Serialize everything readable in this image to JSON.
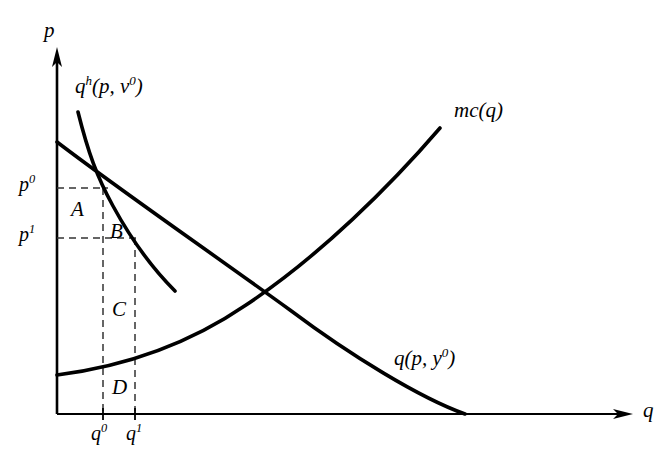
{
  "figure": {
    "background_color": "#ffffff",
    "line_color": "#000000",
    "dash_color": "#4d4d4d"
  },
  "axes": {
    "vertical": {
      "name": "vertical-axis",
      "label": "p",
      "x": 57,
      "y_top": 50,
      "y_bottom": 414
    },
    "horizontal": {
      "name": "horizontal-axis",
      "label": "q",
      "y": 414,
      "x_left": 57,
      "x_right": 632
    },
    "origin": {
      "x": 57,
      "y": 414
    }
  },
  "axis_labels": {
    "price": {
      "text": "p",
      "x": 44,
      "y": 22
    },
    "quantity": {
      "text": "q",
      "x": 644,
      "y": 403
    }
  },
  "price_ticks": [
    {
      "id": "p0",
      "base": "p",
      "sup": "0",
      "value_y": 188,
      "label_x": 20,
      "label_y": 175
    },
    {
      "id": "p1",
      "base": "p",
      "sup": "1",
      "value_y": 238,
      "label_x": 20,
      "label_y": 225
    }
  ],
  "quantity_ticks": [
    {
      "id": "q0",
      "base": "q",
      "sup": "0",
      "value_x": 103,
      "label_x": 91,
      "label_y": 424
    },
    {
      "id": "q1",
      "base": "q",
      "sup": "1",
      "value_x": 135,
      "label_x": 126,
      "label_y": 424
    }
  ],
  "curves": [
    {
      "id": "hicksian-demand",
      "label": "q",
      "label_sup": "h",
      "label_args": "(p, v",
      "label_args_sup": "0",
      "label_close": ")",
      "label_x": 76,
      "label_y": 76,
      "description": "Hicksian (compensated) demand curve, steeper, downward sloping",
      "stroke_width": 3.4,
      "path": "M 78,112 C 88,155 96,176 112,205 C 130,238 152,268 175,291"
    },
    {
      "id": "marshallian-demand",
      "label": "q",
      "label_args": "(p, y",
      "label_args_sup": "0",
      "label_close": ")",
      "label_x": 395,
      "label_y": 348,
      "description": "Marshallian (uncompensated) demand curve, flatter, downward sloping",
      "stroke_width": 3.4,
      "path": "M 57,142 C 120,190 200,245 290,310 C 350,355 420,398 465,414"
    },
    {
      "id": "marginal-cost",
      "label": "mc(q)",
      "label_x": 455,
      "label_y": 100,
      "description": "Marginal cost curve, upward sloping and convex",
      "stroke_width": 3.4,
      "path": "M 57,375 C 120,366 185,345 245,305 C 320,256 390,186 440,128"
    }
  ],
  "regions": [
    {
      "id": "A",
      "label": "A",
      "x": 72,
      "y": 200,
      "description": "rectangle between p0 and p1 left of q0"
    },
    {
      "id": "B",
      "label": "B",
      "x": 111,
      "y": 222,
      "description": "triangle-ish area between q0 and q1 under Hicksian curve"
    },
    {
      "id": "C",
      "label": "C",
      "x": 113,
      "y": 300,
      "description": "area between q0 and q1 below p1 above mc"
    },
    {
      "id": "D",
      "label": "D",
      "x": 113,
      "y": 378,
      "description": "area between q0 and q1 below mc curve"
    }
  ],
  "dashed_lines": [
    {
      "id": "p0-horizontal",
      "x1": 57,
      "y1": 188,
      "x2": 110,
      "y2": 188
    },
    {
      "id": "p1-horizontal",
      "x1": 57,
      "y1": 238,
      "x2": 140,
      "y2": 238
    },
    {
      "id": "q0-vertical",
      "x1": 103,
      "y1": 188,
      "x2": 103,
      "y2": 414
    },
    {
      "id": "q1-vertical",
      "x1": 135,
      "y1": 238,
      "x2": 135,
      "y2": 414
    }
  ]
}
